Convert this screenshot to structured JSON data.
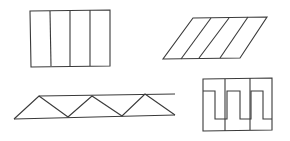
{
  "figure": {
    "width": 290,
    "height": 141,
    "background": "#ffffff",
    "stroke_color": "#3a3a3a",
    "shapes": [
      {
        "name": "rectangle-four-columns",
        "outline": [
          [
            30,
            11
          ],
          [
            110,
            10
          ],
          [
            110,
            66
          ],
          [
            31,
            67
          ]
        ],
        "dividers": [
          [
            [
              50,
              11
            ],
            [
              51,
              66
            ]
          ],
          [
            [
              70,
              11
            ],
            [
              70,
              66
            ]
          ],
          [
            [
              90,
              10
            ],
            [
              90,
              66
            ]
          ]
        ]
      },
      {
        "name": "parallelogram-four-strips",
        "outline": [
          [
            193,
            18
          ],
          [
            267,
            17
          ],
          [
            240,
            58
          ],
          [
            163,
            59
          ]
        ],
        "dividers": [
          [
            [
              211,
              18
            ],
            [
              181,
              59
            ]
          ],
          [
            [
              229,
              18
            ],
            [
              199,
              58
            ]
          ],
          [
            [
              248,
              17
            ],
            [
              220,
              58
            ]
          ]
        ]
      },
      {
        "name": "triangle-truss",
        "top_chord": [
          [
            39,
            96
          ],
          [
            175,
            94
          ]
        ],
        "bottom_chord": [
          [
            14,
            119
          ],
          [
            175,
            115
          ]
        ],
        "web": [
          [
            14,
            119
          ],
          [
            39,
            96
          ],
          [
            68,
            117
          ],
          [
            92,
            96
          ],
          [
            122,
            116
          ],
          [
            145,
            94
          ],
          [
            175,
            115
          ]
        ]
      },
      {
        "name": "zigzag-box",
        "outline": [
          [
            203,
            79
          ],
          [
            272,
            78
          ],
          [
            272,
            130
          ],
          [
            203,
            131
          ]
        ],
        "dividers": [
          [
            [
              225,
              79
            ],
            [
              225,
              131
            ]
          ],
          [
            [
              250,
              78
            ],
            [
              250,
              130
            ]
          ]
        ],
        "zigzag": [
          [
            203,
            91
          ],
          [
            215,
            91
          ],
          [
            215,
            119
          ],
          [
            227,
            119
          ],
          [
            227,
            91
          ],
          [
            240,
            91
          ],
          [
            240,
            119
          ],
          [
            251,
            119
          ],
          [
            251,
            91
          ],
          [
            263,
            91
          ],
          [
            263,
            119
          ],
          [
            272,
            119
          ]
        ]
      }
    ]
  }
}
